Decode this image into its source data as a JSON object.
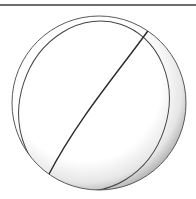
{
  "image": {
    "subject": "ball",
    "description": "Line drawing of a ball with seam curves and soft shading",
    "colors": {
      "outline": "#555555",
      "seam": "#333333",
      "fill": "#ffffff",
      "shadow": "#c8c8c8",
      "top_rule": "#6e6e6e"
    }
  }
}
